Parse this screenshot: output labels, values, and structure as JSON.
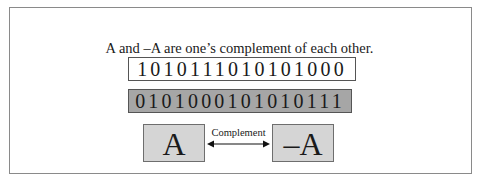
{
  "figure": {
    "caption": "A and –A are one’s complement of each other.",
    "binary_a": "1010111010101000",
    "binary_neg_a": "0101000101010111",
    "box_a_label": "A",
    "box_neg_a_label": "–A",
    "arrow_label": "Complement",
    "colors": {
      "frame_border": "#8a8a8a",
      "neg_bits_fill": "#a6a6a6",
      "box_fill": "#d5d5d5"
    }
  }
}
